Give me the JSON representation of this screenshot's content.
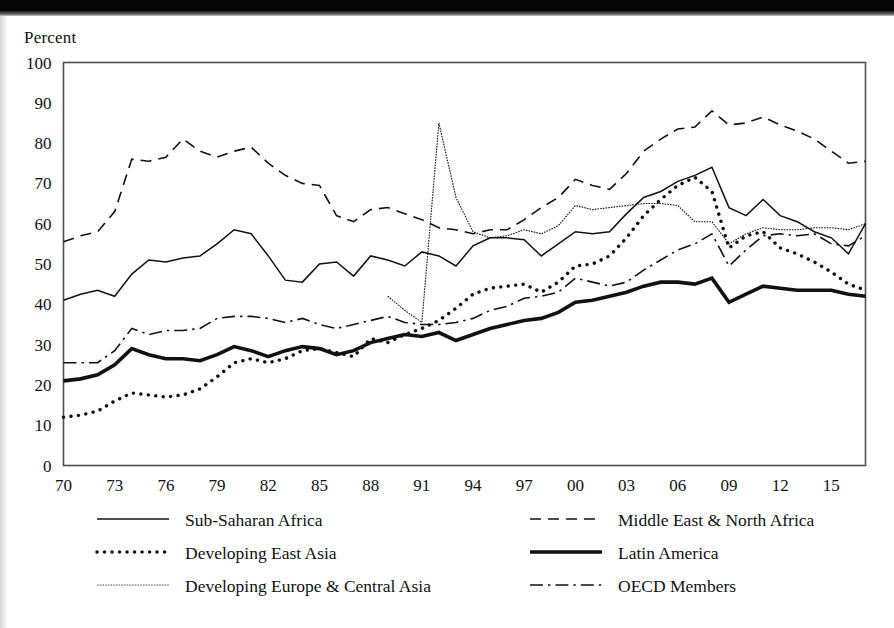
{
  "figure": {
    "axis_label_y": "Percent",
    "scan_artifact": true
  },
  "chart_data": {
    "type": "line",
    "title": "",
    "subtitle": "",
    "xlabel": "",
    "ylabel": "Percent",
    "ylim": [
      0,
      100
    ],
    "xlim": [
      1970,
      2017
    ],
    "ytick_labels": [
      "0",
      "10",
      "20",
      "30",
      "40",
      "50",
      "60",
      "70",
      "80",
      "90",
      "100"
    ],
    "ytick_values": [
      0,
      10,
      20,
      30,
      40,
      50,
      60,
      70,
      80,
      90,
      100
    ],
    "xtick_labels": [
      "70",
      "73",
      "76",
      "79",
      "82",
      "85",
      "88",
      "91",
      "94",
      "97",
      "00",
      "03",
      "06",
      "09",
      "12",
      "15"
    ],
    "xtick_values": [
      1970,
      1973,
      1976,
      1979,
      1982,
      1985,
      1988,
      1991,
      1994,
      1997,
      2000,
      2003,
      2006,
      2009,
      2012,
      2015
    ],
    "grid": false,
    "legend_position": "below-plot-two-columns",
    "x": [
      1970,
      1971,
      1972,
      1973,
      1974,
      1975,
      1976,
      1977,
      1978,
      1979,
      1980,
      1981,
      1982,
      1983,
      1984,
      1985,
      1986,
      1987,
      1988,
      1989,
      1990,
      1991,
      1992,
      1993,
      1994,
      1995,
      1996,
      1997,
      1998,
      1999,
      2000,
      2001,
      2002,
      2003,
      2004,
      2005,
      2006,
      2007,
      2008,
      2009,
      2010,
      2011,
      2012,
      2013,
      2014,
      2015,
      2016,
      2017
    ],
    "series": [
      {
        "name": "Sub-Saharan Africa",
        "style": "solid",
        "color": "#111111",
        "width": 1.5,
        "values": [
          41,
          42.5,
          43.5,
          42,
          47.5,
          51,
          50.5,
          51.5,
          52,
          55,
          58.5,
          57.5,
          52,
          46,
          45.5,
          50,
          50.5,
          47,
          52,
          51,
          49.5,
          53,
          52,
          49.5,
          54.5,
          56.5,
          56.5,
          56,
          52,
          55,
          58,
          57.5,
          58,
          62.5,
          66.5,
          68,
          70.5,
          72,
          74,
          64,
          62,
          66,
          62,
          60.5,
          58,
          56.5,
          52.5,
          60
        ]
      },
      {
        "name": "Middle East & North Africa",
        "style": "dashed",
        "color": "#111111",
        "width": 1.6,
        "values": [
          55.5,
          57,
          58,
          63,
          76,
          75.5,
          76.5,
          81,
          78,
          76.5,
          78,
          79,
          75,
          72,
          70,
          69.5,
          62,
          60.5,
          63.5,
          64,
          62.5,
          61,
          59,
          58.5,
          57.5,
          58.5,
          58.5,
          61,
          64,
          66.5,
          71,
          69.5,
          68.5,
          72.5,
          78,
          81,
          83.5,
          84,
          88,
          84.5,
          85,
          86.5,
          84.5,
          83,
          81,
          78,
          75,
          75.5
        ]
      },
      {
        "name": "Developing East Asia",
        "style": "dotted",
        "color": "#111111",
        "width": 3.4,
        "values": [
          12,
          12.5,
          13.5,
          16,
          18,
          17.5,
          17,
          17.5,
          19,
          22,
          25.5,
          26.5,
          25.5,
          26.5,
          28.5,
          29,
          28,
          27,
          31.5,
          30.5,
          32.5,
          34,
          36,
          39,
          42.5,
          44,
          44.5,
          45,
          43,
          45.5,
          49.5,
          50,
          52,
          56.5,
          62,
          66,
          69.5,
          71.5,
          68,
          54,
          57,
          58,
          54,
          52.5,
          50.5,
          48,
          45,
          43.5
        ]
      },
      {
        "name": "Latin America",
        "style": "solid-thick",
        "color": "#111111",
        "width": 3.6,
        "values": [
          21,
          21.5,
          22.5,
          25,
          29,
          27.5,
          26.5,
          26.5,
          26,
          27.5,
          29.5,
          28.5,
          27,
          28.5,
          29.5,
          29,
          27.5,
          28.5,
          30.5,
          31.5,
          32.5,
          32,
          33,
          31,
          32.5,
          34,
          35,
          36,
          36.5,
          38,
          40.5,
          41,
          42,
          43,
          44.5,
          45.5,
          45.5,
          45,
          46.5,
          40.5,
          42.5,
          44.5,
          44,
          43.5,
          43.5,
          43.5,
          42.5,
          42
        ]
      },
      {
        "name": "Developing Europe & Central Asia",
        "style": "fine-dotted",
        "color": "#555555",
        "width": 1.1,
        "values": [
          null,
          null,
          null,
          null,
          null,
          null,
          null,
          null,
          null,
          null,
          null,
          null,
          null,
          null,
          null,
          null,
          null,
          null,
          null,
          42,
          38.5,
          35.5,
          85,
          66.5,
          58,
          56.5,
          57,
          58.5,
          57.5,
          59.5,
          64.5,
          63.5,
          64,
          64.5,
          65,
          65,
          64.5,
          60.5,
          60.5,
          55,
          57.5,
          59,
          58.5,
          58.5,
          59,
          59,
          58.5,
          60
        ]
      },
      {
        "name": "OECD Members",
        "style": "dash-dot",
        "color": "#111111",
        "width": 1.6,
        "values": [
          25.5,
          25.5,
          25.5,
          28.5,
          34,
          32.5,
          33.5,
          33.5,
          34,
          36.5,
          37,
          37,
          36.5,
          35.5,
          36.5,
          35,
          34,
          35,
          36,
          37,
          35.5,
          35,
          35,
          35.5,
          36.5,
          38.5,
          39.5,
          41.5,
          42,
          43,
          46.5,
          45.5,
          44.5,
          45.5,
          48.5,
          51,
          53.5,
          55,
          57.5,
          49.5,
          53.5,
          57,
          57.5,
          57,
          57.5,
          55,
          54.5,
          57
        ]
      }
    ],
    "annotations": [
      {
        "text": "Spike in Developing Europe & Central Asia in 1992 reaching about 85 percent"
      }
    ]
  },
  "legend": {
    "entries": [
      {
        "label": "Sub-Saharan Africa",
        "style": "solid"
      },
      {
        "label": "Middle East & North Africa",
        "style": "dashed"
      },
      {
        "label": "Developing East Asia",
        "style": "dotted"
      },
      {
        "label": "Latin America",
        "style": "solid-thick"
      },
      {
        "label": "Developing Europe & Central Asia",
        "style": "fine-dotted"
      },
      {
        "label": "OECD Members",
        "style": "dash-dot"
      }
    ]
  }
}
